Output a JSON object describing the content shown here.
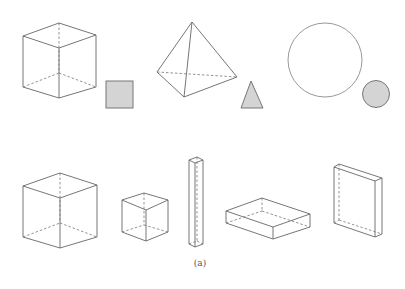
{
  "figure": {
    "caption": "(a)",
    "background": "#ffffff",
    "line_color": "#666666",
    "fill_color": "#d4d4d4"
  },
  "top_row": [
    {
      "solid": "cube",
      "flat_shape": "square"
    },
    {
      "solid": "tetrahedron",
      "flat_shape": "triangle"
    },
    {
      "solid": "sphere",
      "flat_shape": "circle"
    }
  ],
  "bottom_row": [
    {
      "solid": "large-cube"
    },
    {
      "solid": "small-cube"
    },
    {
      "solid": "tall-square-prism"
    },
    {
      "solid": "flat-rectangular-box"
    },
    {
      "solid": "thin-upright-slab"
    }
  ]
}
